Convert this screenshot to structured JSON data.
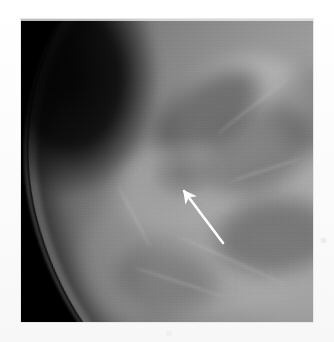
{
  "page": {
    "background_color": "#fdfdfd",
    "width": 334,
    "height": 342,
    "caption": ""
  },
  "figure": {
    "name": "mammogram-radiograph",
    "modality": "Mammography",
    "view_description": "Oblique mammographic projection showing breast contour at upper-right with fibroglandular tissue",
    "frame": {
      "left": 21,
      "top": 19,
      "width": 292,
      "height": 303,
      "background_color": "#000000",
      "border_color": "#e9e9e9"
    },
    "tones": {
      "air_background": "#000000",
      "skin_line": "#d7d7d7",
      "subcutaneous_fat": "#3a3a3a",
      "fibroglandular_bright": "#c4c4c4",
      "parenchyma_mid": "#9a9a9a",
      "fatty_lucency": "#5e5e5e",
      "lesion": "#5c5c5c"
    },
    "regions": [
      {
        "name": "air-background-upper-left",
        "tone": "black",
        "description": "Dark air field occupying the upper-left of the film"
      },
      {
        "name": "skin-contour",
        "tone": "light-gray",
        "description": "Thin bright skin line sweeping from top-right down to lower-left"
      },
      {
        "name": "subcutaneous-fat-band",
        "tone": "dark-gray",
        "description": "Dark fat stripe just deep to the skin line"
      },
      {
        "name": "fibroglandular-tissue",
        "tone": "mid-gray",
        "description": "Heterogeneously dense parenchyma filling the right two-thirds"
      },
      {
        "name": "suspicious-mass",
        "tone": "darker-gray",
        "description": "Ill-defined area of architectural distortion indicated by the arrow"
      }
    ]
  },
  "annotation": {
    "type": "arrow",
    "color": "#ffffff",
    "label": "",
    "points_to": "suspicious-mass",
    "direction": "up-left",
    "tip": {
      "x": 158,
      "y": 167
    },
    "tail": {
      "x": 202,
      "y": 224
    },
    "shaft_width": 2.6,
    "head_length": 13,
    "head_width": 11
  },
  "artifacts": [
    {
      "name": "artifact-right",
      "x": 321,
      "y": 238,
      "description": "Faint scanner speck at right margin"
    },
    {
      "name": "artifact-bottom",
      "x": 166,
      "y": 331,
      "description": "Faint scanner speck below the film"
    }
  ]
}
